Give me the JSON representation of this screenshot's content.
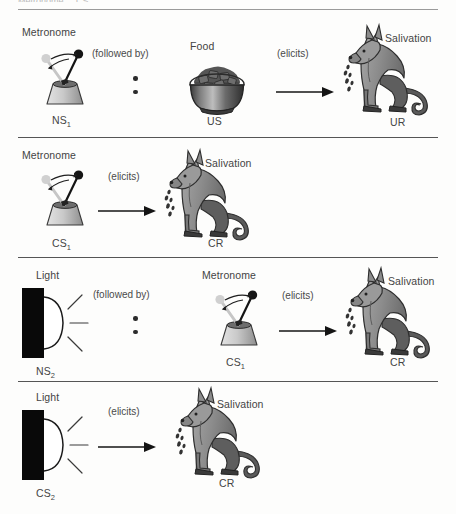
{
  "figure": {
    "cropped_header": "Metronome ... CS",
    "background": "#fdfdfc",
    "ink": "#3b3b3b"
  },
  "colors": {
    "dog_body": "#8d8d8d",
    "dog_dark": "#4f4f4f",
    "dog_outline": "#2e2e2e",
    "metronome_light": "#cfcfcf",
    "metronome_mid": "#9e9e9e",
    "bowl_dark": "#4a4a4a",
    "bowl_mid": "#6e6e6e",
    "lamp_black": "#0a0a0a",
    "rule": "#555555"
  },
  "panels": [
    {
      "id": "panel-1",
      "stimulus": {
        "name": "Metronome",
        "code": "NS",
        "code_sub": "1",
        "icon": "metronome-icon"
      },
      "connector": "(followed by)",
      "connector_marks": "vertical-dots",
      "second_stimulus": {
        "name": "Food",
        "code": "US",
        "icon": "food-bowl-icon"
      },
      "relation": "(elicits)",
      "relation_mark": "right-arrow",
      "response": {
        "name": "Salivation",
        "code": "UR",
        "icon": "salivating-dog-icon"
      }
    },
    {
      "id": "panel-2",
      "stimulus": {
        "name": "Metronome",
        "code": "CS",
        "code_sub": "1",
        "icon": "metronome-icon"
      },
      "relation": "(elicits)",
      "relation_mark": "right-arrow",
      "response": {
        "name": "Salivation",
        "code": "CR",
        "icon": "salivating-dog-icon"
      }
    },
    {
      "id": "panel-3",
      "stimulus": {
        "name": "Light",
        "code": "NS",
        "code_sub": "2",
        "icon": "light-lamp-icon"
      },
      "connector": "(followed by)",
      "connector_marks": "vertical-dots",
      "second_stimulus": {
        "name": "Metronome",
        "code": "CS",
        "code_sub": "1",
        "icon": "metronome-icon"
      },
      "relation": "(elicits)",
      "relation_mark": "right-arrow",
      "response": {
        "name": "Salivation",
        "code": "CR",
        "icon": "salivating-dog-icon"
      }
    },
    {
      "id": "panel-4",
      "stimulus": {
        "name": "Light",
        "code": "CS",
        "code_sub": "2",
        "icon": "light-lamp-icon"
      },
      "relation": "(elicits)",
      "relation_mark": "right-arrow",
      "response": {
        "name": "Salivation",
        "code": "CR",
        "icon": "salivating-dog-icon"
      }
    }
  ]
}
